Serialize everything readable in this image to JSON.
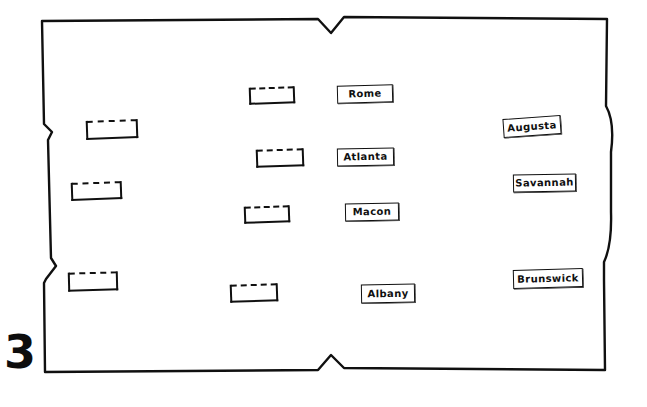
{
  "worksheet": {
    "page_number": "3",
    "title": "Georgia cities map worksheet"
  },
  "map": {
    "outline_name": "georgia-state-outline",
    "stroke_color": "#101010",
    "fill_color": "#ffffff"
  },
  "city_labels": [
    {
      "name": "Rome",
      "x": 337,
      "y": 85,
      "w": 56,
      "h": 18,
      "rotate": -1.5
    },
    {
      "name": "Augusta",
      "x": 503,
      "y": 117,
      "w": 58,
      "h": 19,
      "rotate": -4
    },
    {
      "name": "Atlanta",
      "x": 337,
      "y": 148,
      "w": 57,
      "h": 18,
      "rotate": -1
    },
    {
      "name": "Savannah",
      "x": 513,
      "y": 174,
      "w": 63,
      "h": 18,
      "rotate": -1
    },
    {
      "name": "Macon",
      "x": 345,
      "y": 203,
      "w": 54,
      "h": 18,
      "rotate": -1
    },
    {
      "name": "Brunswick",
      "x": 513,
      "y": 269,
      "w": 70,
      "h": 19,
      "rotate": -1.5
    },
    {
      "name": "Albany",
      "x": 361,
      "y": 284,
      "w": 54,
      "h": 19,
      "rotate": -1
    }
  ],
  "blank_boxes": [
    {
      "label": "blank-box-north-central",
      "x": 249,
      "y": 87,
      "w": 46,
      "h": 17,
      "rotate": -2
    },
    {
      "label": "blank-box-northwest",
      "x": 86,
      "y": 120,
      "w": 52,
      "h": 19,
      "rotate": -2
    },
    {
      "label": "blank-box-central",
      "x": 256,
      "y": 149,
      "w": 48,
      "h": 18,
      "rotate": -2
    },
    {
      "label": "blank-box-west",
      "x": 71,
      "y": 182,
      "w": 51,
      "h": 18,
      "rotate": -2
    },
    {
      "label": "blank-box-mid-central",
      "x": 244,
      "y": 206,
      "w": 46,
      "h": 17,
      "rotate": -2
    },
    {
      "label": "blank-box-southwest",
      "x": 68,
      "y": 272,
      "w": 50,
      "h": 19,
      "rotate": -1.5
    },
    {
      "label": "blank-box-south-central",
      "x": 230,
      "y": 284,
      "w": 48,
      "h": 18,
      "rotate": -2
    }
  ]
}
